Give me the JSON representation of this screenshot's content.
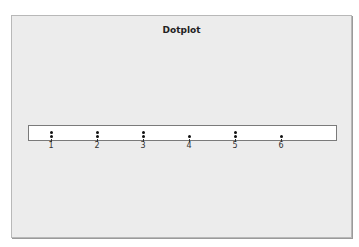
{
  "chart_data": {
    "type": "dotplot",
    "title": "Dotplot",
    "xlabel": "",
    "ylabel": "",
    "categories": [
      "1",
      "2",
      "3",
      "4",
      "5",
      "6"
    ],
    "values": [
      2,
      2,
      2,
      1,
      2,
      1
    ],
    "xlim": [
      0.7,
      7.3
    ],
    "grid": false,
    "legend": null
  }
}
